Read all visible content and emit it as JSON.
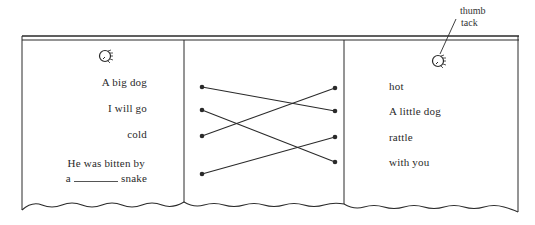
{
  "annotation": {
    "line1": "thumb",
    "line2": "tack"
  },
  "left_card": {
    "items": [
      {
        "text": "A big dog"
      },
      {
        "text": "I will go"
      },
      {
        "text": "cold"
      },
      {
        "text": "He was bitten by"
      }
    ],
    "item4_line2_prefix": "a",
    "item4_line2_suffix": "snake"
  },
  "right_card": {
    "items": [
      {
        "text": "hot"
      },
      {
        "text": "A little dog"
      },
      {
        "text": "rattle"
      },
      {
        "text": "with you"
      }
    ]
  },
  "matching": {
    "connections": [
      {
        "from_left": 1,
        "to_right": 2
      },
      {
        "from_left": 2,
        "to_right": 4
      },
      {
        "from_left": 3,
        "to_right": 1
      },
      {
        "from_left": 4,
        "to_right": 3
      }
    ]
  },
  "colors": {
    "ink": "#2a2a2a",
    "paper": "#ffffff"
  }
}
